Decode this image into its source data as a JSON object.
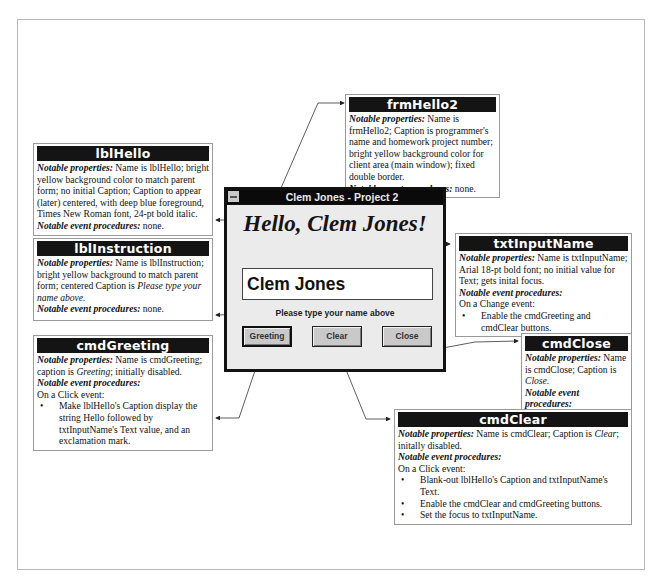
{
  "diagram": {
    "window": {
      "title": "Clem Jones - Project 2",
      "lblHello_caption": "Hello, Clem Jones!",
      "txtInputName_value": "Clem Jones",
      "lblInstruction_caption": "Please type your name above",
      "buttons": [
        {
          "label": "Greeting"
        },
        {
          "label": "Clear"
        },
        {
          "label": "Close"
        }
      ],
      "icons": {
        "system_menu": "system-menu-icon"
      }
    },
    "callouts": {
      "frmHello2": {
        "title": "frmHello2",
        "props_label": "Notable properties:",
        "props_text": " Name is frmHello2; Caption is programmer's name and homework project number; bright yellow background color for client area (main window); fixed double border.",
        "events_label": "Notable event procedures:",
        "events_text": " none."
      },
      "lblHello": {
        "title": "lblHello",
        "props_label": "Notable properties:",
        "props_text": " Name is lblHello; bright yellow background color to match parent form; no initial Caption; Caption to appear (later) centered, with deep blue foreground, Times New Roman font, 24-pt bold italic.",
        "events_label": "Notable event procedures:",
        "events_text": " none."
      },
      "lblInstruction": {
        "title": "lblInstruction",
        "props_label": "Notable properties:",
        "props_text": " Name is lblInstruction; bright yellow background to match parent form; centered Caption is ",
        "props_italic": "Please type your name above.",
        "events_label": "Notable event procedures:",
        "events_text": " none."
      },
      "cmdGreeting": {
        "title": "cmdGreeting",
        "props_label": "Notable properties:",
        "props_text_a": " Name is cmdGreeting; caption is ",
        "props_italic": "Greeting",
        "props_text_b": "; initially disabled.",
        "events_label": "Notable event procedures:",
        "event_intro": "On a Click event:",
        "bullets": [
          "Make lblHello's Caption display the string Hello followed by txtInputName's Text value, and an exclamation mark."
        ]
      },
      "txtInputName": {
        "title": "txtInputName",
        "props_label": "Notable properties:",
        "props_text": " Name is txtInputName; Arial 18-pt bold font; no initial value for Text; gets inital focus.",
        "events_label": "Notable event procedures:",
        "event_intro": "On a Change event:",
        "bullets": [
          "Enable the cmdGreeting and cmdClear buttons."
        ]
      },
      "cmdClose": {
        "title": "cmdClose",
        "props_label": "Notable properties:",
        "props_text_a": " Name is cmdClose; Caption is ",
        "props_italic": "Close",
        "props_text_b": ".",
        "events_label": "Notable event procedures:",
        "event_intro": "On a Click event:",
        "bullets": [
          "End the program."
        ]
      },
      "cmdClear": {
        "title": "cmdClear",
        "props_label": "Notable properties:",
        "props_text_a": " Name is cmdClear; Caption is ",
        "props_italic": "Clear",
        "props_text_b": "; initally disabled.",
        "events_label": "Notable event procedures:",
        "event_intro": "On a Click event:",
        "bullets": [
          "Blank-out lblHello's Caption and txtInputName's Text.",
          "Enable the cmdClear and cmdGreeting buttons.",
          "Set the focus to txtInputName."
        ]
      }
    },
    "colors": {
      "callout_header_bg": "#141414",
      "callout_header_fg": "#ffffff",
      "window_frame": "#121212",
      "client_bg": "#ebebeb",
      "button_face": "#c9c9c9"
    }
  }
}
